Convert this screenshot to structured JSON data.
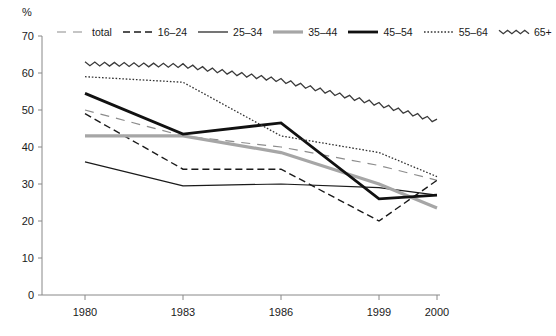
{
  "chart_data": {
    "type": "line",
    "title": "",
    "subtitle": "",
    "xlabel": "",
    "ylabel": "%",
    "unit_label": "%",
    "grid": false,
    "legend_position": "top",
    "categories": [
      "1980",
      "1983",
      "1986",
      "1999",
      "2000"
    ],
    "x_tick_labels": [
      "1980",
      "1983",
      "1986",
      "1999",
      "2000"
    ],
    "y_tick_labels": [
      "0",
      "10",
      "20",
      "30",
      "40",
      "50",
      "60",
      "70"
    ],
    "y_ticks": [
      0,
      10,
      20,
      30,
      40,
      50,
      60,
      70
    ],
    "ylim": [
      0,
      70
    ],
    "series": [
      {
        "name": "total",
        "style": "dashed-long-gray",
        "color": "#8c8c8c",
        "width": 1.2,
        "values": [
          50,
          43,
          40,
          35,
          31
        ]
      },
      {
        "name": "16–24",
        "style": "dashed",
        "color": "#1a1a1a",
        "width": 1.4,
        "values": [
          49,
          34,
          34,
          20,
          31
        ]
      },
      {
        "name": "25–34",
        "style": "solid-thin",
        "color": "#1a1a1a",
        "width": 1.2,
        "values": [
          36,
          29.5,
          30,
          29,
          27
        ]
      },
      {
        "name": "35–44",
        "style": "solid-thick-gray",
        "color": "#a6a6a6",
        "width": 3.2,
        "values": [
          43,
          43,
          38.5,
          30,
          23.5
        ]
      },
      {
        "name": "45–54",
        "style": "solid-thick",
        "color": "#111111",
        "width": 2.8,
        "values": [
          54.5,
          43.5,
          46.5,
          26,
          27
        ]
      },
      {
        "name": "55–64",
        "style": "dotted",
        "color": "#333333",
        "width": 1.3,
        "values": [
          59,
          57.5,
          43,
          38.5,
          32
        ]
      },
      {
        "name": "65+",
        "style": "wavy",
        "color": "#3a3a3a",
        "width": 1.3,
        "values": [
          62.5,
          62,
          58,
          51.5,
          47
        ]
      }
    ]
  },
  "legend": {
    "items": [
      {
        "label": "total"
      },
      {
        "label": "16–24"
      },
      {
        "label": "25–34"
      },
      {
        "label": "35–44"
      },
      {
        "label": "45–54"
      },
      {
        "label": "55–64"
      },
      {
        "label": "65+"
      }
    ]
  },
  "axes": {
    "y_label": "%",
    "axis_color": "#888888"
  }
}
